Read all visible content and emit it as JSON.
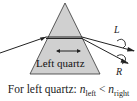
{
  "diagram": {
    "prism_label": "Left quartz",
    "left_beam_label": "L",
    "right_beam_label": "R",
    "caption": {
      "prefix": "For left quartz: ",
      "n1": "n",
      "n1_sub": "left",
      "relation": " < ",
      "n2": "n",
      "n2_sub": "right"
    },
    "colors": {
      "prism_fill": "#cfcfcf",
      "prism_stroke": "#333333",
      "beam": "#222222"
    }
  }
}
